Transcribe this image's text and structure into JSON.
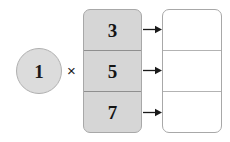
{
  "diagram": {
    "type": "multiplication-distribution-diagram",
    "multiplier": {
      "value": "1",
      "shape": "circle",
      "fill_color": "#dcdcdc",
      "border_color": "#b0b0b0"
    },
    "operator": {
      "symbol": "×",
      "name": "multiplication-sign"
    },
    "input_stack": {
      "fill_color": "#d6d6d6",
      "border_color": "#a8a8a8",
      "cells": [
        {
          "value": "3"
        },
        {
          "value": "5"
        },
        {
          "value": "7"
        }
      ]
    },
    "arrows": [
      {
        "direction": "right"
      },
      {
        "direction": "right"
      },
      {
        "direction": "right"
      }
    ],
    "output_stack": {
      "fill_color": "#ffffff",
      "border_color": "#a8a8a8",
      "cells": [
        {
          "value": ""
        },
        {
          "value": ""
        },
        {
          "value": ""
        }
      ]
    }
  }
}
